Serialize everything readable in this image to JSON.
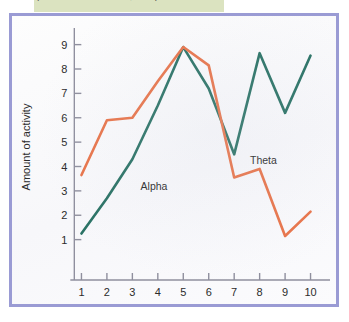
{
  "caption": {
    "text": "(from Corsini & Stafford, 1986)"
  },
  "figure": {
    "border_color": "#9a9bd4",
    "background_color": "#fdfdfd",
    "caption_band_color": "#dbe3c0"
  },
  "chart_data": {
    "type": "line",
    "title": "",
    "xlabel": "Age (years)",
    "ylabel": "Amount of activity",
    "x": [
      1,
      2,
      3,
      4,
      5,
      6,
      7,
      8,
      9,
      10
    ],
    "xticklabels": [
      "1",
      "2",
      "3",
      "4",
      "5",
      "6",
      "7",
      "8",
      "9",
      "10"
    ],
    "yticklabels": [
      "1",
      "2",
      "3",
      "4",
      "5",
      "6",
      "7",
      "8",
      "9"
    ],
    "yticks": [
      1,
      2,
      3,
      4,
      5,
      6,
      7,
      8,
      9
    ],
    "xlim": [
      0.55,
      10.45
    ],
    "ylim": [
      0,
      9.6
    ],
    "grid": false,
    "legend": "inline-annotations",
    "series": [
      {
        "name": "Alpha",
        "color": "#2a7265",
        "values": [
          1.25,
          2.7,
          4.3,
          6.5,
          8.9,
          7.2,
          4.5,
          8.65,
          6.2,
          8.55
        ],
        "label_x": 3.85,
        "label_y": 3.05
      },
      {
        "name": "Theta",
        "color": "#e8744a",
        "values": [
          3.65,
          5.9,
          6.0,
          7.5,
          8.9,
          8.15,
          3.55,
          3.9,
          1.15,
          2.15
        ],
        "label_x": 8.15,
        "label_y": 4.1
      }
    ],
    "annotations": [
      {
        "text": "Alpha",
        "series": "Alpha"
      },
      {
        "text": "Theta",
        "series": "Theta"
      }
    ]
  }
}
